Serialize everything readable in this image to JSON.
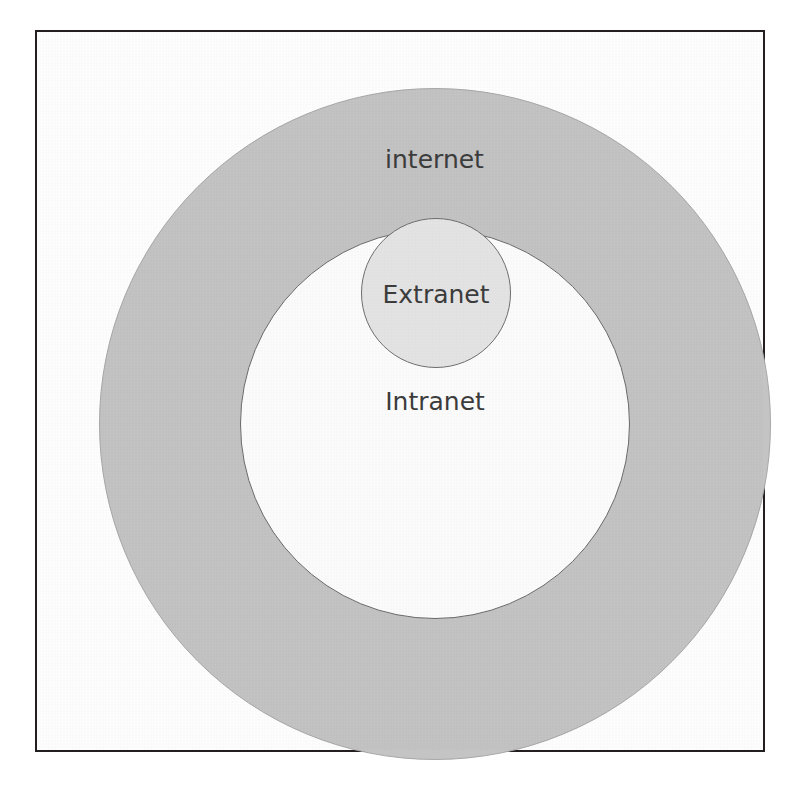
{
  "diagram": {
    "type": "venn-nested-circles",
    "background_color": "#ffffff",
    "frame": {
      "border_color": "#231f20",
      "fill_color": "#ffffff"
    },
    "regions": [
      {
        "id": "internet",
        "label": "internet",
        "fill_color": "#c4c4c4",
        "stroke_color": "#a8a8a8",
        "shape": "circle",
        "level": 1
      },
      {
        "id": "intranet",
        "label": "Intranet",
        "fill_color": "#fdfdfd",
        "stroke_color": "#6b6b6b",
        "shape": "circle",
        "level": 2
      },
      {
        "id": "extranet",
        "label": "Extranet",
        "fill_color": "#e5e5e5",
        "stroke_color": "#6f6f6f",
        "shape": "circle",
        "level": 3
      }
    ],
    "label_color": "#3d3d3d"
  }
}
